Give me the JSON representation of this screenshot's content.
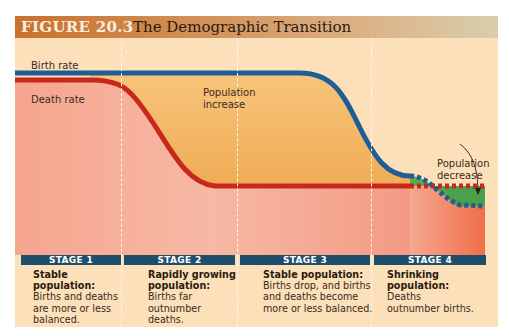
{
  "figure": {
    "number": "FIGURE 20.3",
    "title": "The Demographic Transition"
  },
  "labels": {
    "birth_rate": "Birth rate",
    "death_rate": "Death rate",
    "population_increase_1": "Population",
    "population_increase_2": "increase",
    "population_decrease_1": "Population",
    "population_decrease_2": "decrease"
  },
  "stages": [
    {
      "label": "STAGE 1",
      "heading": "Stable population:",
      "text": "Births and deaths are more or less balanced."
    },
    {
      "label": "STAGE 2",
      "heading": "Rapidly growing population:",
      "text": "Births far outnumber deaths."
    },
    {
      "label": "STAGE 3",
      "heading": "Stable population:",
      "text": "Births drop, and births and deaths become more or less balanced."
    },
    {
      "label": "STAGE 4",
      "heading": "Shrinking population:",
      "text": "Deaths outnumber births."
    }
  ],
  "colors": {
    "birth_line": "#1f5d96",
    "death_line": "#c8281c",
    "increase_fill": "#f2b45c",
    "decrease_fill": "#3f9a3e",
    "stage_bar": "#1f4e6b",
    "background": "#fbe0b9"
  }
}
